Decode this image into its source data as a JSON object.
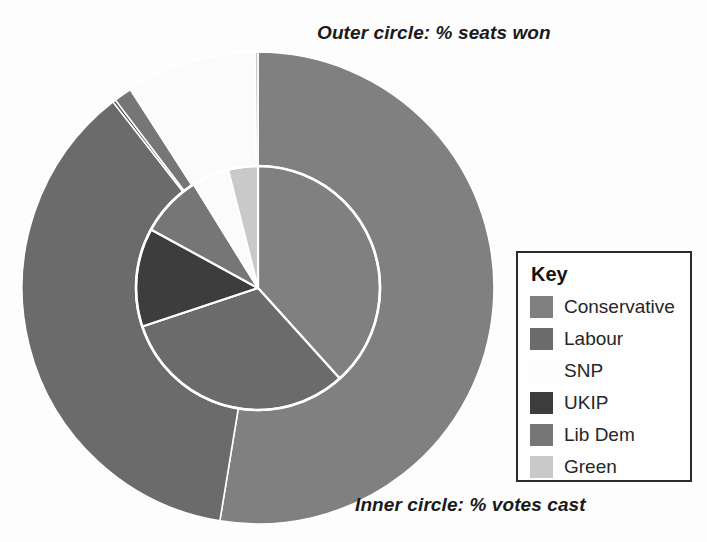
{
  "captions": {
    "outer": "Outer circle: % seats won",
    "inner": "Inner circle: % votes cast"
  },
  "legend": {
    "title": "Key",
    "items": [
      {
        "label": "Conservative",
        "color": "#808080"
      },
      {
        "label": "Labour",
        "color": "#6b6b6b"
      },
      {
        "label": "SNP",
        "color": "#fbfbfb"
      },
      {
        "label": "UKIP",
        "color": "#3d3d3d"
      },
      {
        "label": "Lib Dem",
        "color": "#767676"
      },
      {
        "label": "Green",
        "color": "#c9c9c9"
      }
    ]
  },
  "chart_data": {
    "type": "pie",
    "legend_position": "right",
    "center": {
      "x": 258,
      "y": 288
    },
    "radii": {
      "inner": 122,
      "outer": 236
    },
    "start_angle_deg": 0,
    "direction": "clockwise",
    "categories": [
      "Conservative",
      "Labour",
      "UKIP",
      "Lib Dem",
      "SNP",
      "Green"
    ],
    "colors": [
      "#808080",
      "#6b6b6b",
      "#3d3d3d",
      "#767676",
      "#fbfbfb",
      "#c9c9c9"
    ],
    "series": [
      {
        "name": "Inner circle: % votes cast",
        "unit": "%",
        "values": [
          36.9,
          30.4,
          12.6,
          7.9,
          4.7,
          3.8
        ]
      },
      {
        "name": "Outer circle: % seats won",
        "unit": "%",
        "values": [
          50.9,
          35.7,
          0.2,
          1.2,
          8.6,
          0.2
        ]
      }
    ]
  }
}
